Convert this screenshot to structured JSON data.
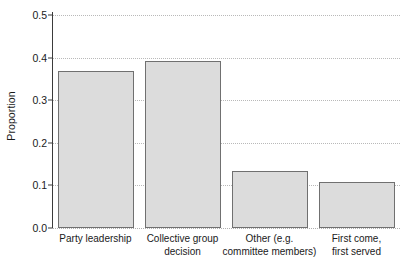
{
  "chart_data": {
    "type": "bar",
    "title": "",
    "xlabel": "",
    "ylabel": "Proportion",
    "categories": [
      "Party leadership",
      "Collective group decision",
      "Other (e.g. committee members)",
      "First come, first served"
    ],
    "category_lines": [
      [
        "Party leadership"
      ],
      [
        "Collective group",
        "decision"
      ],
      [
        "Other (e.g.",
        "committee members)"
      ],
      [
        "First come,",
        "first served"
      ]
    ],
    "values": [
      0.368,
      0.393,
      0.133,
      0.107
    ],
    "ylim": [
      0.0,
      0.5
    ],
    "ytick_values": [
      0.0,
      0.1,
      0.2,
      0.3,
      0.4,
      0.5
    ],
    "ytick_labels": [
      "0.0",
      "0.1",
      "0.2",
      "0.3",
      "0.4",
      "0.5"
    ],
    "grid": true,
    "legend": "none",
    "colors": {
      "bar_fill": "#dcdcdc",
      "bar_edge": "#707070",
      "axis": "#3b3b3b",
      "grid": "#b9b9b9",
      "background": "#ffffff",
      "text": "#1a1a1a"
    }
  }
}
